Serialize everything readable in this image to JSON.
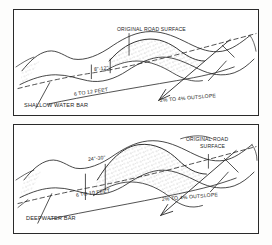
{
  "diagram": {
    "title_semantic": "water-bar-construction-details",
    "panels": [
      {
        "id": "shallow",
        "caption": "SHALLOW WATER BAR",
        "labels": {
          "road_surface": "ORIGINAL ROAD SURFACE",
          "height": "8\"-12\"",
          "length": "6 TO 12 FEET",
          "outslope": "2% TO 4% OUTSLOPE"
        }
      },
      {
        "id": "deep",
        "caption": "DEEPWATER BAR",
        "labels": {
          "road_surface_line1": "ORIGINAL ROAD",
          "road_surface_line2": "SURFACE",
          "height": "24\"-30\"",
          "length": "6 TO 10 FEET",
          "outslope": "2% TO 4% OUTSLOPE"
        }
      }
    ],
    "colors": {
      "ink": "#242424",
      "border": "#2a2a2a",
      "paper": "#ffffff",
      "stipple": "#555555"
    }
  }
}
